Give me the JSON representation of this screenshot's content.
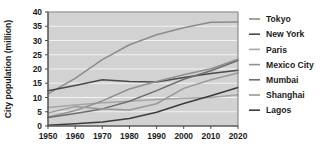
{
  "chart_data": {
    "type": "line",
    "title": "",
    "xlabel": "",
    "ylabel": "City population (million)",
    "x": [
      1950,
      1960,
      1970,
      1980,
      1990,
      2000,
      2010,
      2020
    ],
    "xtick_labels": [
      "1950",
      "1960",
      "1970",
      "1980",
      "1990",
      "2000",
      "2010",
      "2020"
    ],
    "ytick_labels": [
      "0",
      "5",
      "10",
      "15",
      "20",
      "25",
      "30",
      "35",
      "40"
    ],
    "yticks": [
      0,
      5,
      10,
      15,
      20,
      25,
      30,
      35,
      40
    ],
    "xlim": [
      1950,
      2020
    ],
    "ylim": [
      0,
      40
    ],
    "grid": "horizontal",
    "legend_position": "right",
    "plot_background": "#d2d2d2",
    "series": [
      {
        "name": "Tokyo",
        "color": "#8c8c8c",
        "values": [
          11.3,
          16.7,
          23.3,
          28.5,
          32.0,
          34.5,
          36.4,
          36.5
        ]
      },
      {
        "name": "New York",
        "color": "#4a4a4a",
        "values": [
          12.4,
          14.2,
          16.2,
          15.6,
          15.4,
          17.0,
          18.4,
          19.6
        ]
      },
      {
        "name": "Paris",
        "color": "#a5a5a5",
        "values": [
          6.5,
          7.4,
          8.2,
          8.7,
          9.3,
          9.7,
          10.0,
          11.0
        ]
      },
      {
        "name": "Mexico City",
        "color": "#909090",
        "values": [
          3.1,
          5.4,
          8.8,
          13.0,
          15.6,
          18.0,
          20.1,
          23.4
        ]
      },
      {
        "name": "Mumbai",
        "color": "#6e6e6e",
        "values": [
          3.0,
          4.4,
          6.0,
          8.7,
          12.4,
          16.4,
          19.4,
          23.0
        ]
      },
      {
        "name": "Shanghai",
        "color": "#999999",
        "values": [
          4.6,
          6.8,
          6.0,
          5.6,
          7.8,
          13.2,
          16.2,
          18.6
        ]
      },
      {
        "name": "Lagos",
        "color": "#3c3c3c",
        "values": [
          0.3,
          0.8,
          1.4,
          2.6,
          4.8,
          7.9,
          10.6,
          13.5
        ]
      }
    ]
  },
  "legend": {
    "entries": [
      {
        "label": "Tokyo"
      },
      {
        "label": "New York"
      },
      {
        "label": "Paris"
      },
      {
        "label": "Mexico City"
      },
      {
        "label": "Mumbai"
      },
      {
        "label": "Shanghai"
      },
      {
        "label": "Lagos"
      }
    ]
  }
}
